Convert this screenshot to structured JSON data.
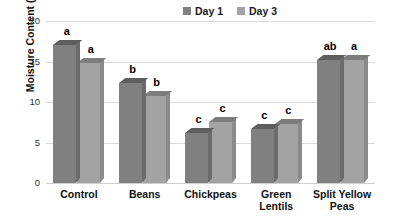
{
  "chart_data": {
    "type": "bar",
    "title": "",
    "subtitle": "",
    "xlabel": "",
    "ylabel": "Moisture Content (g\\100 g)",
    "ylim": [
      0,
      20
    ],
    "yticks": [
      0,
      5,
      10,
      15,
      20
    ],
    "ytick_labels": [
      "0",
      "5",
      "10",
      "15",
      "20"
    ],
    "grid": true,
    "grid_axis": "y",
    "legend_position": "top-center",
    "style": "3d-clustered-column",
    "categories": [
      "Control",
      "Beans",
      "Chickpeas",
      "Green Lentils",
      "Split Yellow Peas"
    ],
    "category_lines": [
      [
        "Control"
      ],
      [
        "Beans"
      ],
      [
        "Chickpeas"
      ],
      [
        "Green",
        "Lentils"
      ],
      [
        "Split Yellow",
        "Peas"
      ]
    ],
    "series": [
      {
        "name": "Day 1",
        "color": "#808080",
        "top_color": "#5e5e5e",
        "side_color": "#6b6b6b",
        "values": [
          17.0,
          12.4,
          6.2,
          6.7,
          15.2
        ],
        "labels": [
          "a",
          "b",
          "c",
          "c",
          "ab"
        ]
      },
      {
        "name": "Day 3",
        "color": "#a3a3a3",
        "top_color": "#7d7d7d",
        "side_color": "#8a8a8a",
        "values": [
          14.8,
          10.7,
          7.5,
          7.3,
          15.2
        ],
        "labels": [
          "a",
          "b",
          "c",
          "c",
          "a"
        ]
      }
    ],
    "annotations": {
      "description": "Letters above bars denote statistical significance groupings",
      "letters": [
        {
          "category": "Control",
          "series": "Day 1",
          "letter": "a"
        },
        {
          "category": "Control",
          "series": "Day 3",
          "letter": "a"
        },
        {
          "category": "Beans",
          "series": "Day 1",
          "letter": "b"
        },
        {
          "category": "Beans",
          "series": "Day 3",
          "letter": "b"
        },
        {
          "category": "Chickpeas",
          "series": "Day 1",
          "letter": "c"
        },
        {
          "category": "Chickpeas",
          "series": "Day 3",
          "letter": "c"
        },
        {
          "category": "Green Lentils",
          "series": "Day 1",
          "letter": "c"
        },
        {
          "category": "Green Lentils",
          "series": "Day 3",
          "letter": "c"
        },
        {
          "category": "Split Yellow Peas",
          "series": "Day 1",
          "letter": "ab"
        },
        {
          "category": "Split Yellow Peas",
          "series": "Day 3",
          "letter": "a"
        }
      ]
    }
  },
  "colors": {
    "day1": "#808080",
    "day3": "#a3a3a3",
    "gridline": "#d9d9d9",
    "text": "#111111",
    "background": "#ffffff"
  }
}
